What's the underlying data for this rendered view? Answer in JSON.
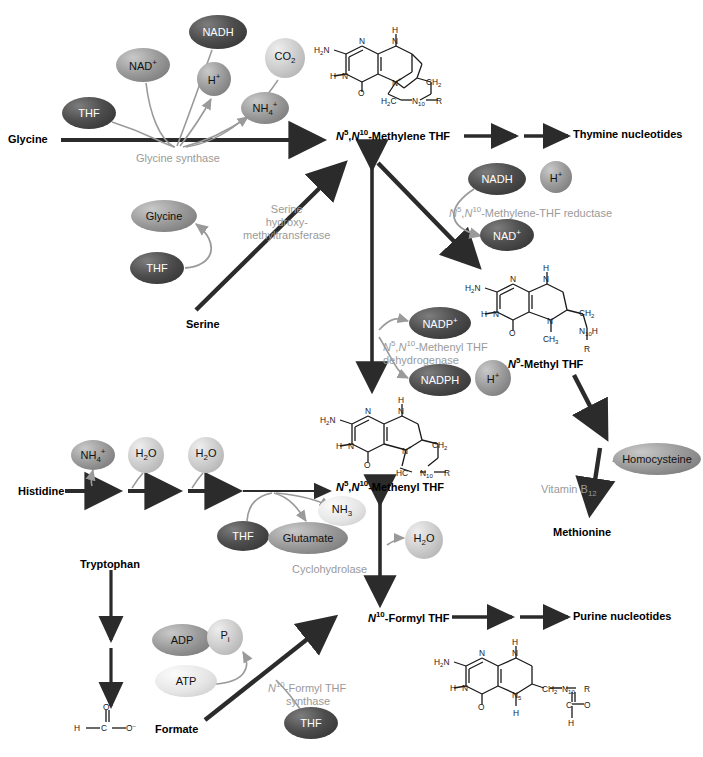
{
  "figure": {
    "colors": {
      "arrow_dark": "#2b2b2b",
      "curve_gray": "#9a9a9a",
      "enzyme_text": "#9a9a9a",
      "ellipse_dark": "#4a4a4a",
      "ellipse_mid": "#8d8d8d",
      "ellipse_light": "#cfcfcf",
      "ellipse_pale": "#e2e2e2",
      "background": "#ffffff"
    }
  },
  "substrates": [
    {
      "id": "glycine",
      "label": "Glycine",
      "x": 8,
      "y": 133
    },
    {
      "id": "serine",
      "label": "Serine",
      "x": 186,
      "y": 318
    },
    {
      "id": "histidine",
      "label": "Histidine",
      "x": 18,
      "y": 485
    },
    {
      "id": "tryptophan",
      "label": "Tryptophan",
      "x": 90,
      "y": 558
    },
    {
      "id": "formate",
      "label": "Formate",
      "x": 155,
      "y": 723
    },
    {
      "id": "methionine",
      "label": "Methionine",
      "x": 553,
      "y": 526
    }
  ],
  "products": [
    {
      "id": "thymine-nucleotides",
      "label": "Thymine nucleotides",
      "x": 573,
      "y": 133
    },
    {
      "id": "purine-nucleotides",
      "label": "Purine nucleotides",
      "x": 573,
      "y": 614
    }
  ],
  "folate_forms": [
    {
      "id": "n5-n10-methylene-thf",
      "label": "N5,N10-Methylene THF",
      "html": "<i>N</i><sup>5</sup>,<i>N</i><sup>10</sup>-Methylene THF",
      "x": 336,
      "y": 133
    },
    {
      "id": "n5-methyl-thf",
      "label": "N5-Methyl THF",
      "html": "<i>N</i><sup>5</sup>-Methyl THF",
      "x": 508,
      "y": 356
    },
    {
      "id": "n5-n10-methenyl-thf",
      "label": "N5,N10-Methenyl THF",
      "html": "<i>N</i><sup>5</sup>,<i>N</i><sup>10</sup>-Methenyl THF",
      "x": 336,
      "y": 484
    },
    {
      "id": "n10-formyl-thf",
      "label": "N10-Formyl THF",
      "html": "<i>N</i><sup>10</sup>-Formyl THF",
      "x": 368,
      "y": 614
    }
  ],
  "enzymes": [
    {
      "id": "glycine-synthase",
      "lines": [
        "Glycine synthase"
      ],
      "x": 136,
      "y": 152,
      "align": "left"
    },
    {
      "id": "serine-hydroxymethyltransferase",
      "lines": [
        "Serine",
        "hydroxy-",
        "methyltransferase"
      ],
      "x": 243,
      "y": 205,
      "align": "center"
    },
    {
      "id": "methylene-thf-reductase",
      "lines": [
        "N5,N10-Methylene-THF reductase"
      ],
      "html": [
        "<i>N</i><sup>5</sup>,<i>N</i><sup>10</sup>-Methylene-THF reductase"
      ],
      "x": 449,
      "y": 203,
      "align": "left"
    },
    {
      "id": "methenyl-thf-dehydrogenase",
      "lines": [
        "N5,N10-Methenyl THF",
        "dehydrogenase"
      ],
      "html": [
        "<i>N</i><sup>5</sup>,<i>N</i><sup>10</sup>-Methenyl THF",
        "dehydrogenase"
      ],
      "x": 383,
      "y": 339,
      "align": "left"
    },
    {
      "id": "cyclohydrolase",
      "lines": [
        "Cyclohydrolase"
      ],
      "x": 297,
      "y": 563,
      "align": "left"
    },
    {
      "id": "vitamin-b12",
      "lines": [
        "Vitamin B12"
      ],
      "html": [
        "Vitamin B<sub>12</sub>"
      ],
      "x": 541,
      "y": 483,
      "align": "left"
    },
    {
      "id": "formyl-thf-synthase",
      "lines": [
        "N10-Formyl THF",
        "synthase"
      ],
      "html": [
        "<i>N</i><sup>10</sup>-Formyl THF",
        "synthase"
      ],
      "x": 268,
      "y": 680,
      "align": "left"
    }
  ],
  "metabolite_bubbles": [
    {
      "id": "nadh-glycine",
      "label": "NADH",
      "html": "NADH",
      "cx": 218,
      "cy": 32,
      "rx": 29,
      "ry": 17,
      "tone": "dark"
    },
    {
      "id": "co2",
      "label": "CO2",
      "html": "CO<sub>2</sub>",
      "cx": 285,
      "cy": 58,
      "rx": 20,
      "ry": 20,
      "tone": "light"
    },
    {
      "id": "nad-plus-gly",
      "label": "NAD+",
      "html": "NAD<sup>+</sup>",
      "cx": 143,
      "cy": 65,
      "rx": 27,
      "ry": 17,
      "tone": "mid"
    },
    {
      "id": "h-plus-gly",
      "label": "H+",
      "html": "H<sup>+</sup>",
      "cx": 214,
      "cy": 79,
      "rx": 17,
      "ry": 17,
      "tone": "mid"
    },
    {
      "id": "nh4-plus",
      "label": "NH4+",
      "html": "NH<sub>4</sub><sup>+</sup>",
      "cx": 265,
      "cy": 108,
      "rx": 24,
      "ry": 16,
      "tone": "mid"
    },
    {
      "id": "thf-glycine",
      "label": "THF",
      "html": "THF",
      "cx": 89,
      "cy": 113,
      "rx": 27,
      "ry": 16,
      "tone": "dark"
    },
    {
      "id": "glycine-bubble",
      "label": "Glycine",
      "html": "Glycine",
      "cx": 164,
      "cy": 216,
      "rx": 33,
      "ry": 16,
      "tone": "mid"
    },
    {
      "id": "thf-serine",
      "label": "THF",
      "html": "THF",
      "cx": 157,
      "cy": 268,
      "rx": 27,
      "ry": 16,
      "tone": "dark"
    },
    {
      "id": "nadh-red",
      "label": "NADH",
      "html": "NADH",
      "cx": 497,
      "cy": 179,
      "rx": 29,
      "ry": 16,
      "tone": "dark"
    },
    {
      "id": "h-plus-red",
      "label": "H+",
      "html": "H<sup>+</sup>",
      "cx": 556,
      "cy": 177,
      "rx": 16,
      "ry": 16,
      "tone": "mid"
    },
    {
      "id": "nad-plus-red",
      "label": "NAD+",
      "html": "NAD<sup>+</sup>",
      "cx": 507,
      "cy": 235,
      "rx": 27,
      "ry": 16,
      "tone": "dark"
    },
    {
      "id": "nadp-plus",
      "label": "NADP+",
      "html": "NADP<sup>+</sup>",
      "cx": 440,
      "cy": 323,
      "rx": 31,
      "ry": 16,
      "tone": "dark"
    },
    {
      "id": "nadph",
      "label": "NADPH",
      "html": "NADPH",
      "cx": 440,
      "cy": 380,
      "rx": 31,
      "ry": 16,
      "tone": "dark"
    },
    {
      "id": "h-plus-deh",
      "label": "H+",
      "html": "H<sup>+</sup>",
      "cx": 493,
      "cy": 378,
      "rx": 18,
      "ry": 18,
      "tone": "mid"
    },
    {
      "id": "nh4-his",
      "label": "NH4+",
      "html": "NH<sub>4</sub><sup>+</sup>",
      "cx": 93,
      "cy": 455,
      "rx": 22,
      "ry": 15,
      "tone": "mid"
    },
    {
      "id": "h2o-his1",
      "label": "H2O",
      "html": "H<sub>2</sub>O",
      "cx": 146,
      "cy": 455,
      "rx": 18,
      "ry": 18,
      "tone": "light"
    },
    {
      "id": "h2o-his2",
      "label": "H2O",
      "html": "H<sub>2</sub>O",
      "cx": 206,
      "cy": 455,
      "rx": 18,
      "ry": 18,
      "tone": "light"
    },
    {
      "id": "nh3",
      "label": "NH3",
      "html": "NH<sub>3</sub>",
      "cx": 342,
      "cy": 511,
      "rx": 24,
      "ry": 15,
      "tone": "pale"
    },
    {
      "id": "thf-his",
      "label": "THF",
      "html": "THF",
      "cx": 243,
      "cy": 536,
      "rx": 26,
      "ry": 15,
      "tone": "dark"
    },
    {
      "id": "glutamate",
      "label": "Glutamate",
      "html": "Glutamate",
      "cx": 308,
      "cy": 538,
      "rx": 40,
      "ry": 16,
      "tone": "mid"
    },
    {
      "id": "h2o-cyclo",
      "label": "H2O",
      "html": "H<sub>2</sub>O",
      "cx": 424,
      "cy": 540,
      "rx": 19,
      "ry": 19,
      "tone": "light"
    },
    {
      "id": "homocysteine",
      "label": "Homocysteine",
      "html": "Homocysteine",
      "cx": 657,
      "cy": 459,
      "rx": 44,
      "ry": 16,
      "tone": "mid"
    },
    {
      "id": "adp",
      "label": "ADP",
      "html": "ADP",
      "cx": 182,
      "cy": 640,
      "rx": 30,
      "ry": 16,
      "tone": "mid"
    },
    {
      "id": "pi",
      "label": "Pi",
      "html": "P<sub>i</sub>",
      "cx": 225,
      "cy": 637,
      "rx": 18,
      "ry": 18,
      "tone": "light"
    },
    {
      "id": "atp",
      "label": "ATP",
      "html": "ATP",
      "cx": 186,
      "cy": 681,
      "rx": 31,
      "ry": 16,
      "tone": "pale"
    },
    {
      "id": "thf-formate",
      "label": "THF",
      "html": "THF",
      "cx": 311,
      "cy": 723,
      "rx": 27,
      "ry": 16,
      "tone": "dark"
    }
  ],
  "formate_structure": {
    "id": "formate-anion",
    "atoms": [
      "H",
      "C",
      "O",
      "O-"
    ],
    "x": 74,
    "y": 700
  },
  "structures": [
    {
      "id": "methylene-thf-structure",
      "caption": "N5,N10-Methylene THF",
      "x": 316,
      "y": 26
    },
    {
      "id": "methyl-thf-structure",
      "caption": "N5-Methyl THF",
      "x": 462,
      "y": 262
    },
    {
      "id": "methenyl-thf-structure",
      "caption": "N5,N10-Methenyl THF",
      "x": 322,
      "y": 395
    },
    {
      "id": "formyl-thf-structure",
      "caption": "N10-Formyl THF",
      "x": 432,
      "y": 636
    }
  ]
}
